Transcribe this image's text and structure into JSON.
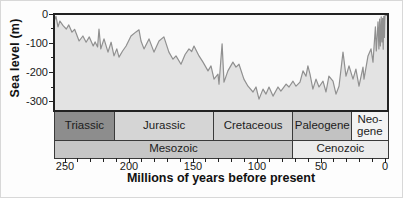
{
  "chart_data": {
    "type": "area",
    "title": "",
    "xlabel": "Millions of years before present",
    "ylabel": "Sea level (m)",
    "x_axis_reversed": true,
    "xlim": [
      259,
      0
    ],
    "ylim": [
      -331,
      0
    ],
    "x_ticks": [
      250,
      200,
      150,
      100,
      50,
      0
    ],
    "x_minor_step": 10,
    "y_ticks": [
      0,
      -100,
      -200,
      -300
    ],
    "y_minor_step": 50,
    "grid": false,
    "legend": "none",
    "styles": {
      "plot_bg": "#fafafa",
      "area_fill": "#e3e3e3",
      "line_color": "#909090",
      "frame_color": "#222222",
      "tick_color": "#222222",
      "band_border": "#3a3a3a",
      "text_color": "#111111"
    },
    "series": [
      {
        "name": "Sea level",
        "points": [
          [
            258.5,
            -25
          ],
          [
            257,
            -8
          ],
          [
            255.5,
            -44
          ],
          [
            254,
            -24
          ],
          [
            251.5,
            -40
          ],
          [
            249,
            -51
          ],
          [
            247,
            -37
          ],
          [
            244.5,
            -62
          ],
          [
            242.5,
            -52
          ],
          [
            239,
            -92
          ],
          [
            236,
            -75
          ],
          [
            233.5,
            -96
          ],
          [
            231,
            -78
          ],
          [
            228,
            -109
          ],
          [
            226.5,
            -95
          ],
          [
            224.5,
            -112
          ],
          [
            223.4,
            -51
          ],
          [
            222,
            -119
          ],
          [
            219.5,
            -85
          ],
          [
            216.4,
            -130
          ],
          [
            214,
            -96
          ],
          [
            211.7,
            -143
          ],
          [
            209.5,
            -119
          ],
          [
            207.8,
            -147
          ],
          [
            205,
            -126
          ],
          [
            202.3,
            -109
          ],
          [
            198.4,
            -75
          ],
          [
            194.5,
            -61
          ],
          [
            192.2,
            -54
          ],
          [
            190.6,
            -92
          ],
          [
            188.3,
            -119
          ],
          [
            184.4,
            -85
          ],
          [
            180.5,
            -130
          ],
          [
            176.6,
            -92
          ],
          [
            172.7,
            -78
          ],
          [
            168.8,
            -130
          ],
          [
            165.6,
            -154
          ],
          [
            163.3,
            -143
          ],
          [
            159.4,
            -171
          ],
          [
            156.2,
            -138
          ],
          [
            153.1,
            -119
          ],
          [
            151,
            -128
          ],
          [
            149.2,
            -109
          ],
          [
            145.3,
            -143
          ],
          [
            142.2,
            -164
          ],
          [
            138.3,
            -194
          ],
          [
            135.9,
            -177
          ],
          [
            133.6,
            -222
          ],
          [
            130.5,
            -205
          ],
          [
            129.7,
            -239
          ],
          [
            127.3,
            -102
          ],
          [
            125.8,
            -232
          ],
          [
            122.7,
            -194
          ],
          [
            118.8,
            -164
          ],
          [
            116.4,
            -181
          ],
          [
            114.1,
            -171
          ],
          [
            110.2,
            -222
          ],
          [
            107,
            -246
          ],
          [
            103.1,
            -266
          ],
          [
            100.8,
            -249
          ],
          [
            98.4,
            -290
          ],
          [
            95.3,
            -256
          ],
          [
            93,
            -273
          ],
          [
            90.6,
            -249
          ],
          [
            87.5,
            -280
          ],
          [
            83.6,
            -249
          ],
          [
            81.3,
            -263
          ],
          [
            77.3,
            -239
          ],
          [
            75,
            -249
          ],
          [
            71.9,
            -229
          ],
          [
            69.5,
            -246
          ],
          [
            66.4,
            -232
          ],
          [
            64.1,
            -194
          ],
          [
            61.7,
            -212
          ],
          [
            60.2,
            -177
          ],
          [
            58.6,
            -205
          ],
          [
            56.3,
            -256
          ],
          [
            53.9,
            -222
          ],
          [
            51.6,
            -249
          ],
          [
            48.4,
            -229
          ],
          [
            46.1,
            -266
          ],
          [
            43.8,
            -212
          ],
          [
            40.6,
            -229
          ],
          [
            38.3,
            -273
          ],
          [
            35.9,
            -246
          ],
          [
            32.8,
            -130
          ],
          [
            30.5,
            -212
          ],
          [
            28.1,
            -177
          ],
          [
            25,
            -222
          ],
          [
            22.7,
            -188
          ],
          [
            20.3,
            -246
          ],
          [
            17.2,
            -181
          ],
          [
            16.4,
            -222
          ],
          [
            13.3,
            -143
          ],
          [
            10.9,
            -119
          ],
          [
            9.4,
            -164
          ],
          [
            7.5,
            -44
          ],
          [
            6.8,
            -126
          ],
          [
            5.5,
            -27
          ],
          [
            4.8,
            -119
          ],
          [
            4.2,
            -17
          ],
          [
            3.6,
            -109
          ],
          [
            3,
            -10
          ],
          [
            2.4,
            -95
          ],
          [
            1.9,
            -15
          ],
          [
            1.4,
            -120
          ],
          [
            0.9,
            -8
          ],
          [
            0.5,
            -80
          ],
          [
            0.1,
            -5
          ]
        ]
      }
    ],
    "period_bands": [
      {
        "label_lines": [
          "Triassic"
        ],
        "from_ma": 259,
        "to_ma": 211,
        "color": "#8d8d8d"
      },
      {
        "label_lines": [
          "Jurassic"
        ],
        "from_ma": 211,
        "to_ma": 134,
        "color": "#d5d5d5"
      },
      {
        "label_lines": [
          "Cretaceous"
        ],
        "from_ma": 134,
        "to_ma": 72,
        "color": "#d2d2d2"
      },
      {
        "label_lines": [
          "Paleogene"
        ],
        "from_ma": 72,
        "to_ma": 26,
        "color": "#c2c2c2"
      },
      {
        "label_lines": [
          "Neo-",
          "gene"
        ],
        "from_ma": 26,
        "to_ma": 0,
        "color": "#f3f3f3"
      }
    ],
    "era_bands": [
      {
        "label_lines": [
          "Mesozoic"
        ],
        "from_ma": 259,
        "to_ma": 72,
        "color": "#c6c6c6"
      },
      {
        "label_lines": [
          "Cenozoic"
        ],
        "from_ma": 72,
        "to_ma": 0,
        "color": "#ececec"
      }
    ]
  }
}
